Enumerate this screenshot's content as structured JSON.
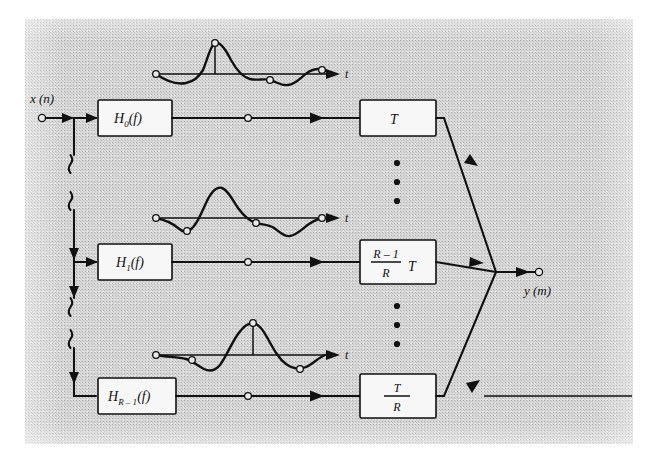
{
  "figure": {
    "input_label": "x (n)",
    "output_label": "y (m)",
    "background_color": "#d8d8d8",
    "ink_color": "#111111"
  },
  "channels": [
    {
      "filter_label": "H",
      "filter_sub": "0",
      "filter_arg": "(f)",
      "decimator_label": "T",
      "decimator_kind": "plain",
      "waveform_axis_label": "t"
    },
    {
      "filter_label": "H",
      "filter_sub": "1",
      "filter_arg": "(f)",
      "decimator_numerator": "R – 1",
      "decimator_denominator": "R",
      "decimator_suffix": "T",
      "decimator_kind": "fraction_suffix",
      "waveform_axis_label": "t"
    },
    {
      "filter_label": "H",
      "filter_sub": "R – 1",
      "filter_arg": "(f)",
      "decimator_numerator": "T",
      "decimator_denominator": "R",
      "decimator_kind": "fraction",
      "waveform_axis_label": "t"
    }
  ],
  "ellipses": [
    {
      "name": "upper-vertical-ellipsis",
      "dots": 3
    },
    {
      "name": "lower-vertical-ellipsis",
      "dots": 3
    }
  ],
  "chart_data": [
    {
      "type": "line",
      "name": "impulse-response-channel-0",
      "title": "",
      "xlabel": "t",
      "ylabel": "",
      "grid": false,
      "legend": null,
      "x": [
        0.0,
        0.08,
        0.16,
        0.24,
        0.3,
        0.36,
        0.44,
        0.52,
        0.6,
        0.68,
        0.76,
        0.84,
        0.92,
        1.0
      ],
      "y": [
        0.0,
        -0.18,
        -0.22,
        -0.05,
        0.55,
        1.0,
        0.8,
        0.35,
        0.0,
        -0.3,
        -0.34,
        -0.12,
        0.18,
        0.12
      ],
      "markers_x": [
        0.0,
        0.36,
        0.6,
        0.92
      ],
      "markers_y": [
        0.0,
        1.0,
        0.0,
        0.18
      ],
      "peak_stem_x": 0.36,
      "peak_stem_y": 1.0
    },
    {
      "type": "line",
      "name": "impulse-response-channel-1",
      "title": "",
      "xlabel": "t",
      "ylabel": "",
      "grid": false,
      "legend": null,
      "x": [
        0.0,
        0.08,
        0.14,
        0.2,
        0.26,
        0.34,
        0.42,
        0.5,
        0.58,
        0.66,
        0.74,
        0.82,
        0.9,
        1.0
      ],
      "y": [
        0.0,
        -0.1,
        -0.3,
        -0.34,
        -0.05,
        0.7,
        1.0,
        0.72,
        0.15,
        -0.3,
        -0.4,
        -0.28,
        -0.06,
        0.0
      ],
      "markers_x": [
        0.0,
        0.2,
        0.52,
        0.9
      ],
      "markers_y": [
        0.0,
        -0.34,
        0.05,
        0.0
      ],
      "peak_stem_x": null,
      "peak_stem_y": null
    },
    {
      "type": "line",
      "name": "impulse-response-channel-R-1",
      "title": "",
      "xlabel": "t",
      "ylabel": "",
      "grid": false,
      "legend": null,
      "x": [
        0.0,
        0.1,
        0.2,
        0.28,
        0.36,
        0.44,
        0.52,
        0.58,
        0.64,
        0.72,
        0.8,
        0.88,
        0.96,
        1.0
      ],
      "y": [
        0.0,
        -0.04,
        -0.12,
        -0.32,
        -0.26,
        0.2,
        0.8,
        1.0,
        0.82,
        0.25,
        -0.22,
        -0.3,
        -0.1,
        0.0
      ],
      "markers_x": [
        0.0,
        0.22,
        0.58,
        0.84
      ],
      "markers_y": [
        0.0,
        -0.18,
        1.0,
        -0.28
      ],
      "peak_stem_x": 0.58,
      "peak_stem_y": 1.0
    },
    {
      "type": "bar",
      "name": "output-sequence-stem-plot",
      "title": "",
      "xlabel": "",
      "ylabel": "",
      "grid": false,
      "legend": null,
      "categories": [
        "0",
        "1",
        "2",
        "3",
        "4",
        "5",
        "6",
        "7",
        "8",
        "9",
        "10",
        "11",
        "12",
        "13",
        "14",
        "15",
        "16",
        "17",
        "18",
        "19",
        "20",
        "21",
        "22",
        "23",
        "24",
        "25",
        "26",
        "27",
        "28"
      ],
      "values": [
        -0.1,
        -0.22,
        -0.3,
        -0.34,
        -0.26,
        -0.1,
        0.4,
        0.72,
        1.0,
        0.88,
        0.74,
        0.46,
        0.22,
        0.04,
        -0.16,
        -0.34,
        -0.44,
        -0.48,
        -0.46,
        -0.4,
        -0.3,
        -0.12,
        0.1,
        0.18,
        0.26,
        0.22,
        0.12,
        0.04,
        0.0
      ],
      "ylim": [
        -0.6,
        1.1
      ]
    }
  ]
}
